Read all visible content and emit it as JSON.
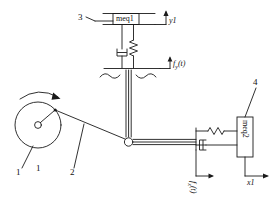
{
  "figure": {
    "type": "mechanical-schematic",
    "stroke_color": "#1a1a1a",
    "background_color": "#ffffff"
  },
  "labels": {
    "callout_1_rod": "1",
    "callout_1_disc": "1",
    "callout_2": "2",
    "callout_3": "3",
    "callout_4": "4"
  },
  "masses": {
    "vertical_mass": "meq1",
    "horizontal_mass": "meq2"
  },
  "variables": {
    "vertical_displacement": "y1",
    "horizontal_displacement": "x1",
    "vertical_force": "f",
    "vertical_force_sub": "y",
    "vertical_force_arg": "(t)",
    "horizontal_force": "f",
    "horizontal_force_sub": "x",
    "horizontal_force_arg": "(t)"
  },
  "elements": {
    "crank_disc": "crank-disc",
    "rotation_arrow": "rotation-arrow",
    "connecting_rod": "connecting-rod",
    "pin_joint": "pin-joint",
    "vertical_rod": "vertical-rod",
    "horizontal_rod": "horizontal-rod",
    "vertical_spring": "spring",
    "vertical_damper": "damper",
    "horizontal_spring": "spring",
    "horizontal_damper": "damper",
    "break_line": "wavy-break-line",
    "ground_bar": "ground-bar"
  }
}
